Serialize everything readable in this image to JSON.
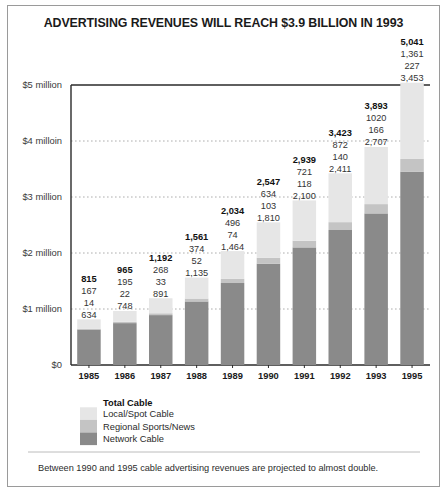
{
  "chart_data": {
    "type": "bar",
    "title": "ADVERTISING REVENUES WILL REACH $3.9 BILLION IN 1993",
    "xlabel": "",
    "ylabel": "",
    "ylim": [
      0,
      5000
    ],
    "grid": true,
    "stacked": true,
    "legend_position": "bottom-left",
    "categories": [
      "1985",
      "1986",
      "1987",
      "1988",
      "1989",
      "1990",
      "1991",
      "1992",
      "1993",
      "1995"
    ],
    "ytick_labels": [
      "$0",
      "$1 million",
      "$2 million",
      "$3 million",
      "$4 milloin",
      "$5 million"
    ],
    "ytick_values": [
      0,
      1000,
      2000,
      3000,
      4000,
      5000
    ],
    "series": [
      {
        "name": "Network Cable",
        "color": "#8a8a8a",
        "values": [
          634,
          748,
          891,
          1135,
          1464,
          1810,
          2100,
          2411,
          2707,
          3453
        ],
        "labels": [
          "634",
          "748",
          "891",
          "1,135",
          "1,464",
          "1,810",
          "2,100",
          "2,411",
          "2,707",
          "3,453"
        ]
      },
      {
        "name": "Regional Sports/News",
        "color": "#c4c4c4",
        "values": [
          14,
          22,
          33,
          52,
          74,
          103,
          118,
          140,
          166,
          227
        ],
        "labels": [
          "14",
          "22",
          "33",
          "52",
          "74",
          "103",
          "118",
          "140",
          "166",
          "227"
        ]
      },
      {
        "name": "Local/Spot Cable",
        "color": "#e6e6e6",
        "values": [
          167,
          195,
          268,
          374,
          496,
          634,
          721,
          872,
          1020,
          1361
        ],
        "labels": [
          "167",
          "195",
          "268",
          "374",
          "496",
          "634",
          "721",
          "872",
          "1020",
          "1,361"
        ]
      }
    ],
    "totals": [
      815,
      965,
      1192,
      1561,
      2034,
      2547,
      2939,
      3423,
      3893,
      5041
    ],
    "total_labels": [
      "815",
      "965",
      "1,192",
      "1,561",
      "2,034",
      "2,547",
      "2,939",
      "3,423",
      "3,893",
      "5,041"
    ]
  },
  "legend": {
    "title": "Total Cable",
    "items": [
      {
        "label": "Local/Spot Cable",
        "color": "#e6e6e6"
      },
      {
        "label": "Regional Sports/News",
        "color": "#c4c4c4"
      },
      {
        "label": "Network Cable",
        "color": "#8a8a8a"
      }
    ]
  },
  "footnote": {
    "text": "Between 1990 and 1995 cable advertising revenues are projected to almost double."
  },
  "colors": {
    "frame": "#9a9a9a",
    "axis": "#2a2a2a",
    "grid": "#9b9b9b",
    "text": "#2b2b2b"
  }
}
